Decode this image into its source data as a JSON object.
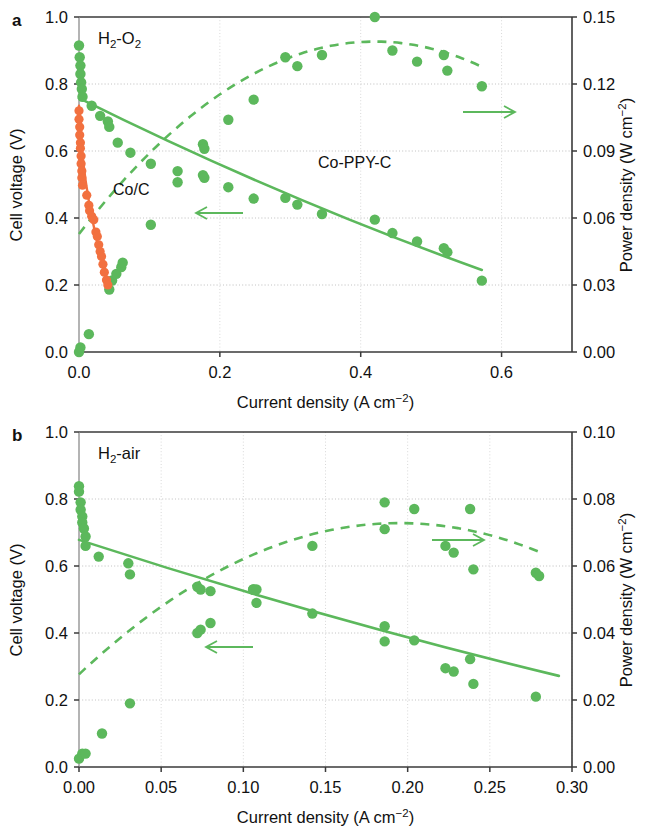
{
  "figure": {
    "panels": [
      "a",
      "b"
    ],
    "colors": {
      "green": "#5cb85c",
      "orange": "#f2703f",
      "axis": "#3a3a3a",
      "grid": "#d8d8d8",
      "text": "#111111"
    }
  },
  "panel_a": {
    "letter": "a",
    "condition_label": "H₂-O₂",
    "condition_label_main": "H",
    "condition_label_sub": "2",
    "condition_label_rest": "-O",
    "condition_label_sub2": "2",
    "series_label_green": "Co-PPY-C",
    "series_label_orange": "Co/C",
    "x_axis_title": "Current density (A cm",
    "x_axis_title_sup": "−2",
    "x_axis_title_end": ")",
    "y_left_title": "Cell voltage (V)",
    "y_right_title": "Power density (W cm",
    "y_right_title_sup": "−2",
    "y_right_title_end": ")",
    "x_ticks": [
      "0.0",
      "0.2",
      "0.4",
      "0.6"
    ],
    "y_left_ticks": [
      "0.0",
      "0.2",
      "0.4",
      "0.6",
      "0.8",
      "1.0"
    ],
    "y_right_ticks": [
      "0.00",
      "0.03",
      "0.06",
      "0.09",
      "0.12",
      "0.15"
    ],
    "arrow_left_name": "left-pointing-arrow",
    "arrow_right_name": "right-pointing-arrow"
  },
  "panel_b": {
    "letter": "b",
    "condition_label": "H₂-air",
    "condition_label_main": "H",
    "condition_label_sub": "2",
    "condition_label_rest": "-air",
    "x_axis_title": "Current density (A cm",
    "x_axis_title_sup": "−2",
    "x_axis_title_end": ")",
    "y_left_title": "Cell voltage (V)",
    "y_right_title": "Power density (W cm",
    "y_right_title_sup": "−2",
    "y_right_title_end": ")",
    "x_ticks": [
      "0.00",
      "0.05",
      "0.10",
      "0.15",
      "0.20",
      "0.25",
      "0.30"
    ],
    "y_left_ticks": [
      "0.0",
      "0.2",
      "0.4",
      "0.6",
      "0.8",
      "1.0"
    ],
    "y_right_ticks": [
      "0.00",
      "0.02",
      "0.04",
      "0.06",
      "0.08",
      "0.10"
    ],
    "arrow_left_name": "left-pointing-arrow",
    "arrow_right_name": "right-pointing-arrow"
  },
  "chart_data": [
    {
      "type": "scatter",
      "panel": "a",
      "title": "H2-O2 fuel cell polarization and power density",
      "xlabel": "Current density (A cm-2)",
      "ylabel": "Cell voltage (V)",
      "y2label": "Power density (W cm-2)",
      "xlim": [
        0.0,
        0.7
      ],
      "ylim": [
        0.0,
        1.0
      ],
      "y2lim": [
        0.0,
        0.15
      ],
      "xticks": [
        0.0,
        0.2,
        0.4,
        0.6
      ],
      "yticks": [
        0.0,
        0.2,
        0.4,
        0.6,
        0.8,
        1.0
      ],
      "y2ticks": [
        0.0,
        0.03,
        0.06,
        0.09,
        0.12,
        0.15
      ],
      "grid": true,
      "legend": [
        "Co-PPY-C",
        "Co/C"
      ],
      "legend_position": "inline-annotation",
      "series": [
        {
          "name": "Co-PPY-C polarization",
          "axis": "left",
          "color": "#5cb85c",
          "marker": "circle",
          "line": "solid",
          "points": [
            [
              0.0,
              0.915
            ],
            [
              0.001,
              0.88
            ],
            [
              0.002,
              0.855
            ],
            [
              0.002,
              0.83
            ],
            [
              0.003,
              0.805
            ],
            [
              0.004,
              0.785
            ],
            [
              0.005,
              0.762
            ],
            [
              0.018,
              0.735
            ],
            [
              0.03,
              0.705
            ],
            [
              0.041,
              0.688
            ],
            [
              0.043,
              0.672
            ],
            [
              0.055,
              0.625
            ],
            [
              0.073,
              0.595
            ],
            [
              0.102,
              0.562
            ],
            [
              0.14,
              0.54
            ],
            [
              0.176,
              0.528
            ],
            [
              0.178,
              0.52
            ],
            [
              0.212,
              0.492
            ],
            [
              0.248,
              0.458
            ],
            [
              0.293,
              0.46
            ],
            [
              0.31,
              0.44
            ],
            [
              0.345,
              0.412
            ],
            [
              0.42,
              0.395
            ],
            [
              0.445,
              0.355
            ],
            [
              0.48,
              0.33
            ],
            [
              0.518,
              0.31
            ],
            [
              0.523,
              0.298
            ],
            [
              0.572,
              0.213
            ]
          ],
          "fit_line": [
            [
              0.0,
              0.758
            ],
            [
              0.572,
              0.245
            ]
          ]
        },
        {
          "name": "Co-PPY-C power density",
          "axis": "right",
          "color": "#5cb85c",
          "marker": "circle",
          "line": "dashed",
          "points": [
            [
              0.0,
              0.0
            ],
            [
              0.002,
              0.002
            ],
            [
              0.014,
              0.008
            ],
            [
              0.043,
              0.028
            ],
            [
              0.047,
              0.032
            ],
            [
              0.053,
              0.035
            ],
            [
              0.06,
              0.038
            ],
            [
              0.062,
              0.04
            ],
            [
              0.102,
              0.057
            ],
            [
              0.14,
              0.076
            ],
            [
              0.176,
              0.093
            ],
            [
              0.178,
              0.091
            ],
            [
              0.212,
              0.104
            ],
            [
              0.248,
              0.113
            ],
            [
              0.293,
              0.132
            ],
            [
              0.31,
              0.128
            ],
            [
              0.345,
              0.133
            ],
            [
              0.42,
              0.15
            ],
            [
              0.445,
              0.135
            ],
            [
              0.48,
              0.13
            ],
            [
              0.518,
              0.133
            ],
            [
              0.523,
              0.126
            ],
            [
              0.572,
              0.119
            ]
          ],
          "fit_curve_peak": [
            0.42,
            0.139
          ]
        },
        {
          "name": "Co/C polarization",
          "axis": "left",
          "color": "#f2703f",
          "marker": "circle",
          "line": "solid",
          "points": [
            [
              0.0,
              0.72
            ],
            [
              0.0,
              0.695
            ],
            [
              0.001,
              0.672
            ],
            [
              0.001,
              0.648
            ],
            [
              0.002,
              0.625
            ],
            [
              0.002,
              0.608
            ],
            [
              0.003,
              0.585
            ],
            [
              0.003,
              0.562
            ],
            [
              0.004,
              0.54
            ],
            [
              0.004,
              0.52
            ],
            [
              0.005,
              0.498
            ],
            [
              0.011,
              0.468
            ],
            [
              0.014,
              0.438
            ],
            [
              0.015,
              0.422
            ],
            [
              0.018,
              0.405
            ],
            [
              0.021,
              0.395
            ],
            [
              0.024,
              0.358
            ],
            [
              0.026,
              0.345
            ],
            [
              0.028,
              0.32
            ],
            [
              0.03,
              0.3
            ],
            [
              0.032,
              0.285
            ],
            [
              0.034,
              0.262
            ],
            [
              0.036,
              0.238
            ],
            [
              0.039,
              0.215
            ],
            [
              0.041,
              0.2
            ]
          ],
          "fit_line": [
            [
              0.0,
              0.735
            ],
            [
              0.042,
              0.2
            ]
          ]
        }
      ]
    },
    {
      "type": "scatter",
      "panel": "b",
      "title": "H2-air fuel cell polarization and power density",
      "xlabel": "Current density (A cm-2)",
      "ylabel": "Cell voltage (V)",
      "y2label": "Power density (W cm-2)",
      "xlim": [
        0.0,
        0.3
      ],
      "ylim": [
        0.0,
        1.0
      ],
      "y2lim": [
        0.0,
        0.1
      ],
      "xticks": [
        0.0,
        0.05,
        0.1,
        0.15,
        0.2,
        0.25,
        0.3
      ],
      "yticks": [
        0.0,
        0.2,
        0.4,
        0.6,
        0.8,
        1.0
      ],
      "y2ticks": [
        0.0,
        0.02,
        0.04,
        0.06,
        0.08,
        0.1
      ],
      "grid": true,
      "legend": [
        "Co-PPY-C"
      ],
      "legend_position": "inline-annotation",
      "series": [
        {
          "name": "Co-PPY-C polarization",
          "axis": "left",
          "color": "#5cb85c",
          "marker": "circle",
          "line": "solid",
          "points": [
            [
              0.0,
              0.838
            ],
            [
              0.0,
              0.822
            ],
            [
              0.001,
              0.79
            ],
            [
              0.001,
              0.768
            ],
            [
              0.002,
              0.748
            ],
            [
              0.002,
              0.73
            ],
            [
              0.003,
              0.712
            ],
            [
              0.004,
              0.688
            ],
            [
              0.004,
              0.66
            ],
            [
              0.012,
              0.628
            ],
            [
              0.03,
              0.608
            ],
            [
              0.031,
              0.575
            ],
            [
              0.072,
              0.538
            ],
            [
              0.074,
              0.53
            ],
            [
              0.08,
              0.525
            ],
            [
              0.106,
              0.53
            ],
            [
              0.108,
              0.49
            ],
            [
              0.142,
              0.458
            ],
            [
              0.186,
              0.42
            ],
            [
              0.186,
              0.375
            ],
            [
              0.204,
              0.378
            ],
            [
              0.223,
              0.295
            ],
            [
              0.228,
              0.285
            ],
            [
              0.238,
              0.322
            ],
            [
              0.24,
              0.248
            ],
            [
              0.278,
              0.21
            ]
          ],
          "fit_line": [
            [
              0.0,
              0.678
            ],
            [
              0.292,
              0.272
            ]
          ]
        },
        {
          "name": "Co-PPY-C power density",
          "axis": "right",
          "color": "#5cb85c",
          "marker": "circle",
          "line": "dashed",
          "points": [
            [
              0.0,
              0.0025
            ],
            [
              0.002,
              0.004
            ],
            [
              0.004,
              0.004
            ],
            [
              0.014,
              0.01
            ],
            [
              0.031,
              0.019
            ],
            [
              0.072,
              0.04
            ],
            [
              0.074,
              0.041
            ],
            [
              0.08,
              0.043
            ],
            [
              0.106,
              0.053
            ],
            [
              0.108,
              0.053
            ],
            [
              0.142,
              0.066
            ],
            [
              0.186,
              0.079
            ],
            [
              0.186,
              0.071
            ],
            [
              0.204,
              0.077
            ],
            [
              0.223,
              0.066
            ],
            [
              0.228,
              0.064
            ],
            [
              0.238,
              0.077
            ],
            [
              0.24,
              0.059
            ],
            [
              0.278,
              0.058
            ],
            [
              0.28,
              0.057
            ]
          ],
          "fit_curve_peak": [
            0.195,
            0.0728
          ]
        }
      ]
    }
  ]
}
